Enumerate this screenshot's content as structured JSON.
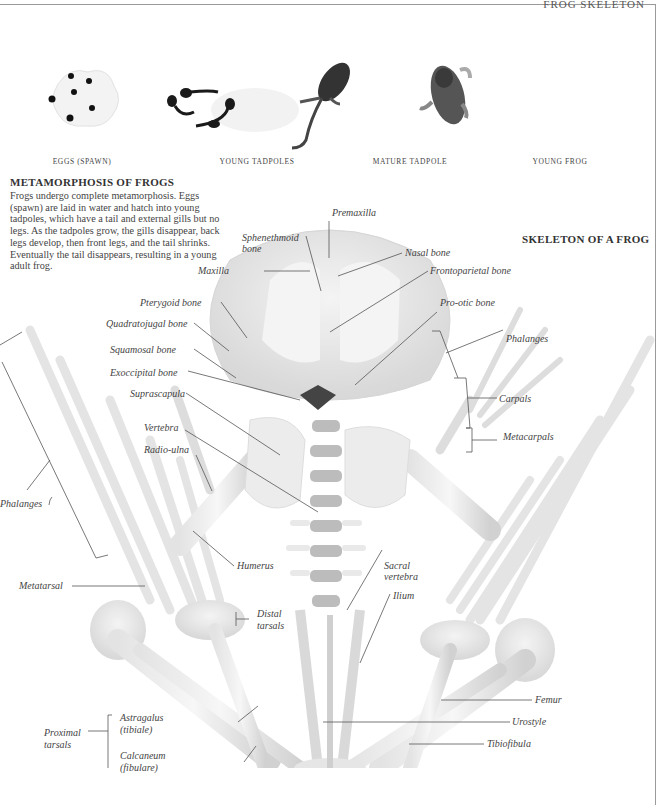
{
  "header": {
    "running_head": "FROG SKELETON"
  },
  "stages": [
    {
      "caption": "EGGS (SPAWN)",
      "icon": "frog-eggs-image"
    },
    {
      "caption": "YOUNG TADPOLES",
      "icon": "young-tadpoles-image"
    },
    {
      "caption": "MATURE TADPOLE",
      "icon": "mature-tadpole-image"
    },
    {
      "caption": "YOUNG FROG",
      "icon": "young-frog-image"
    }
  ],
  "metamorphosis": {
    "title": "METAMORPHOSIS OF FROGS",
    "body": "Frogs undergo complete metamorphosis. Eggs (spawn) are laid in water and hatch into young tadpoles, which have a tail and external gills but no legs. As the tadpoles grow, the gills disappear, back legs develop, then front legs, and the tail shrinks. Eventually the tail disappears, resulting in a young adult frog."
  },
  "skeleton": {
    "title": "SKELETON OF A FROG",
    "labels": {
      "premaxilla": "Premaxilla",
      "sphenethmoid": "Sphenethmoid",
      "sphenethmoid2": "bone",
      "nasal": "Nasal bone",
      "maxilla": "Maxilla",
      "frontoparietal": "Frontoparietal bone",
      "pterygoid": "Pterygoid bone",
      "prootic": "Pro-otic bone",
      "quadratojugal": "Quadratojugal bone",
      "phalanges_hand": "Phalanges",
      "squamosal": "Squamosal bone",
      "exoccipital": "Exoccipital bone",
      "carpals": "Carpals",
      "suprascapula": "Suprascapula",
      "metacarpals": "Metacarpals",
      "vertebra": "Vertebra",
      "radioulna": "Radio-ulna",
      "phalanges_foot": "Phalanges",
      "humerus": "Humerus",
      "sacral1": "Sacral",
      "sacral2": "vertebra",
      "metatarsal": "Metatarsal",
      "ilium": "Ilium",
      "distal1": "Distal",
      "distal2": "tarsals",
      "femur": "Femur",
      "astragalus1": "Astragalus",
      "astragalus2": "(tibiale)",
      "urostyle": "Urostyle",
      "proximal1": "Proximal",
      "proximal2": "tarsals",
      "tibiofibula": "Tibiofibula",
      "calcaneum1": "Calcaneum",
      "calcaneum2": "(fibulare)"
    }
  }
}
